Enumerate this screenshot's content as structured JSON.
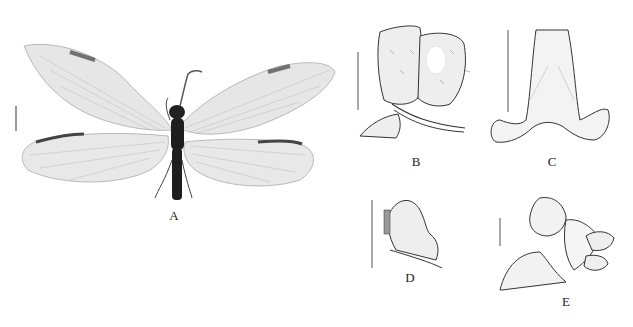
{
  "figure": {
    "panels": [
      {
        "id": "A",
        "label": "A",
        "description": "dorsal habitus, adult specimen with spread wings"
      },
      {
        "id": "B",
        "label": "B",
        "description": "lateral view of terminalia, setose lobes"
      },
      {
        "id": "C",
        "label": "C",
        "description": "sclerite, ventral view"
      },
      {
        "id": "D",
        "label": "D",
        "description": "setose lobe with row of pegs"
      },
      {
        "id": "E",
        "label": "E",
        "description": "lateral view of terminalia"
      }
    ],
    "scale_bars": [
      "A",
      "B",
      "C",
      "D",
      "E"
    ]
  },
  "colors": {
    "background": "#ffffff",
    "ink": "#333333",
    "wing_membrane": "#e4e4e4",
    "wing_spot": "#555555",
    "body": "#1e1e1e"
  }
}
